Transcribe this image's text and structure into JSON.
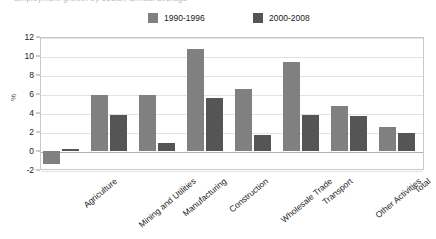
{
  "title": {
    "text": "Employment growth by sector, annual average"
  },
  "legend": {
    "position": "top",
    "entries": [
      {
        "label": "1990-1996",
        "color": "#808080",
        "name": "legend-item-1990-1996"
      },
      {
        "label": "2000-2008",
        "color": "#555555",
        "name": "legend-item-2000-2008"
      }
    ]
  },
  "y_axis": {
    "title": "%",
    "ticks": [
      "12",
      "10",
      "8",
      "6",
      "4",
      "2",
      "0",
      "-2"
    ]
  },
  "chart_data": {
    "type": "bar",
    "title": "Employment growth by sector, annual average",
    "xlabel": "",
    "ylabel": "%",
    "ylim": [
      -2,
      12
    ],
    "yticks": [
      -2,
      0,
      2,
      4,
      6,
      8,
      10,
      12
    ],
    "grid": true,
    "legend_position": "top",
    "categories": [
      "Agriculture",
      "Mining and Utilities",
      "Manufacturing",
      "Construction",
      "Wholesale Trade",
      "Transport",
      "Other Activities",
      "Total"
    ],
    "series": [
      {
        "name": "1990-1996",
        "color": "#808080",
        "values": [
          -1.4,
          5.9,
          5.9,
          10.7,
          6.5,
          9.4,
          4.7,
          2.5
        ]
      },
      {
        "name": "2000-2008",
        "color": "#555555",
        "values": [
          0.2,
          3.8,
          0.8,
          5.6,
          1.7,
          3.8,
          3.7,
          1.9
        ]
      }
    ]
  }
}
